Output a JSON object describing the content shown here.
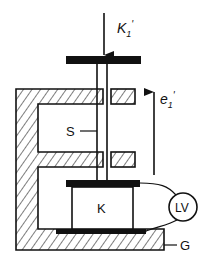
{
  "diagram": {
    "type": "mechanical-schematic",
    "labels": {
      "force": "K",
      "force_sub": "1",
      "force_prime": "'",
      "direction": "e",
      "direction_sub": "1",
      "direction_prime": "'",
      "shaft": "S",
      "body": "K",
      "instrument": "LV",
      "housing": "G"
    },
    "colors": {
      "stroke": "#111111",
      "background": "#ffffff"
    }
  }
}
